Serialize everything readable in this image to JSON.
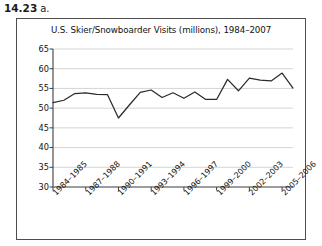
{
  "exercise": {
    "number": "14.23",
    "part": "a."
  },
  "chart_data": {
    "type": "line",
    "title": "U.S. Skier/Snowboarder Visits (millions), 1984–2007",
    "xlabel": "",
    "ylabel": "",
    "ylim": [
      30,
      65
    ],
    "ytick_step": 5,
    "ytick_labels": [
      "65",
      "60",
      "55",
      "50",
      "45",
      "40",
      "35",
      "30"
    ],
    "ytick_values": [
      65,
      60,
      55,
      50,
      45,
      40,
      35,
      30
    ],
    "grid": "horizontal",
    "legend": "none",
    "line_color": "#2b2b2b",
    "categories": [
      "1984–1985",
      "1985–1986",
      "1986–1987",
      "1987–1988",
      "1988–1989",
      "1989–1990",
      "1990–1991",
      "1991–1992",
      "1992–1993",
      "1993–1994",
      "1994–1995",
      "1995–1996",
      "1996–1997",
      "1997–1998",
      "1998–1999",
      "1999–2000",
      "2000–2001",
      "2001–2002",
      "2002–2003",
      "2003–2004",
      "2004–2005",
      "2005–2006",
      "2006–2007"
    ],
    "xtick_labels": [
      "1984–1985",
      "1987–1988",
      "1990–1991",
      "1993–1994",
      "1996–1997",
      "1999–2000",
      "2002–2003",
      "2005–2006"
    ],
    "xtick_indices": [
      0,
      3,
      6,
      9,
      12,
      15,
      18,
      21
    ],
    "values": [
      51.4,
      52.0,
      53.7,
      53.9,
      53.5,
      53.4,
      47.5,
      50.8,
      54.0,
      54.6,
      52.7,
      53.9,
      52.5,
      54.1,
      52.2,
      52.2,
      57.3,
      54.4,
      57.6,
      57.1,
      56.9,
      58.9,
      55.1
    ]
  }
}
